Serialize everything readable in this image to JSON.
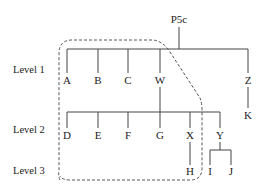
{
  "diagram": {
    "type": "tree",
    "root": {
      "id": "P5c",
      "label": "P5c"
    },
    "levels": [
      {
        "label": "Level 1"
      },
      {
        "label": "Level 2"
      },
      {
        "label": "Level 3"
      }
    ],
    "nodes": {
      "P5c": "P5c",
      "A": "A",
      "B": "B",
      "C": "C",
      "W": "W",
      "Z": "Z",
      "K": "K",
      "D": "D",
      "E": "E",
      "F": "F",
      "G": "G",
      "X": "X",
      "Y": "Y",
      "H": "H",
      "I": "I",
      "J": "J"
    },
    "edges": [
      [
        "P5c",
        "A"
      ],
      [
        "P5c",
        "B"
      ],
      [
        "P5c",
        "C"
      ],
      [
        "P5c",
        "W"
      ],
      [
        "P5c",
        "Z"
      ],
      [
        "Z",
        "K"
      ],
      [
        "W",
        "D"
      ],
      [
        "W",
        "E"
      ],
      [
        "W",
        "F"
      ],
      [
        "W",
        "G"
      ],
      [
        "W",
        "X"
      ],
      [
        "W",
        "Y"
      ],
      [
        "X",
        "H"
      ],
      [
        "Y",
        "I"
      ],
      [
        "Y",
        "J"
      ]
    ],
    "highlighted_group": {
      "style": "dashed",
      "members": [
        "A",
        "B",
        "C",
        "W",
        "D",
        "E",
        "F",
        "G",
        "X",
        "H"
      ]
    }
  }
}
